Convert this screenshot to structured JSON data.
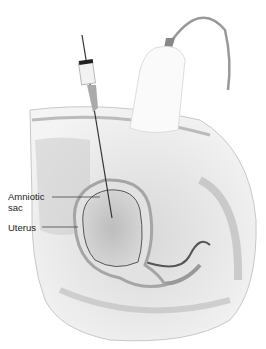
{
  "figure": {
    "labels": [
      {
        "text_line1": "Amniotic",
        "text_line2": "sac"
      },
      {
        "text_line1": "Uterus"
      }
    ]
  }
}
